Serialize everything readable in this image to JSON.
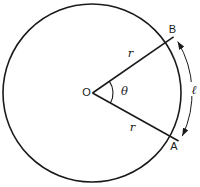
{
  "diagram": {
    "labels": {
      "center": "O",
      "point_top": "B",
      "point_bottom": "A",
      "radius_top": "r",
      "radius_bottom": "r",
      "angle": "θ",
      "arc_length": "ℓ"
    },
    "colors": {
      "line": "#1a1a1a",
      "background": "#ffffff"
    }
  }
}
